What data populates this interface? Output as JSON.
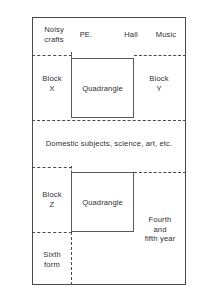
{
  "diagram": {
    "frame": {
      "stroke": "#4a4a4a"
    },
    "top_row_labels": {
      "noisy_crafts": "Noisy\ncrafts",
      "pe": "PE.",
      "hall": "Hall",
      "music": "Music"
    },
    "blocks": {
      "block_x": "Block\nX",
      "block_y": "Block\nY",
      "block_z": "Block\nZ"
    },
    "quadrangles": {
      "top": "Quadrangle",
      "bottom": "Quadrangle"
    },
    "bands": {
      "domestic": "Domestic subjects, science, art, etc."
    },
    "year_groups": {
      "fourth_fifth": "Fourth\nand\nfifth year",
      "sixth_form": "Sixth\nform"
    }
  }
}
